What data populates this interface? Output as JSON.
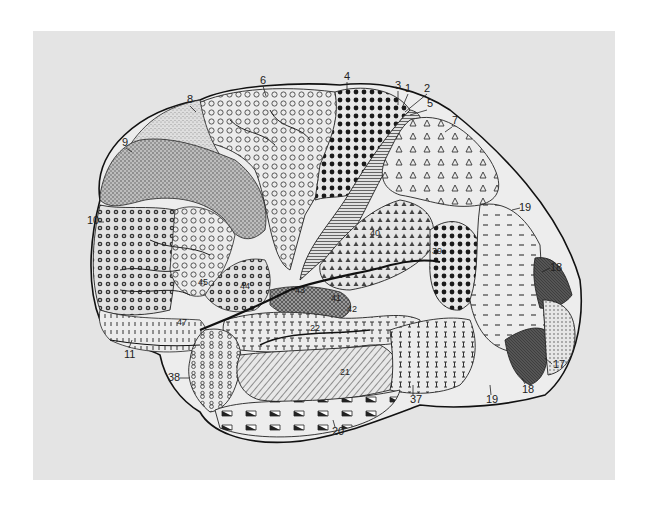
{
  "figure": {
    "background_color": "#e4e4e4",
    "labels": [
      {
        "id": "1",
        "text": "1",
        "x": 405,
        "y": 92
      },
      {
        "id": "2",
        "text": "2",
        "x": 424,
        "y": 92
      },
      {
        "id": "3",
        "text": "3",
        "x": 395,
        "y": 89
      },
      {
        "id": "4",
        "text": "4",
        "x": 344,
        "y": 80
      },
      {
        "id": "5",
        "text": "5",
        "x": 427,
        "y": 107
      },
      {
        "id": "6",
        "text": "6",
        "x": 260,
        "y": 84
      },
      {
        "id": "7",
        "text": "7",
        "x": 452,
        "y": 124
      },
      {
        "id": "8",
        "text": "8",
        "x": 187,
        "y": 103
      },
      {
        "id": "9",
        "text": "9",
        "x": 122,
        "y": 146
      },
      {
        "id": "10",
        "text": "10",
        "x": 87,
        "y": 224
      },
      {
        "id": "11",
        "text": "11",
        "x": 124,
        "y": 358
      },
      {
        "id": "17",
        "text": "17",
        "x": 553,
        "y": 368
      },
      {
        "id": "18a",
        "text": "18",
        "x": 550,
        "y": 271
      },
      {
        "id": "18b",
        "text": "18",
        "x": 522,
        "y": 393
      },
      {
        "id": "19a",
        "text": "19",
        "x": 519,
        "y": 211
      },
      {
        "id": "19b",
        "text": "19",
        "x": 486,
        "y": 403
      },
      {
        "id": "20",
        "text": "20",
        "x": 332,
        "y": 435
      },
      {
        "id": "21",
        "text": "21",
        "x": 340,
        "y": 375
      },
      {
        "id": "22",
        "text": "22",
        "x": 310,
        "y": 331
      },
      {
        "id": "37",
        "text": "37",
        "x": 410,
        "y": 403
      },
      {
        "id": "38",
        "text": "38",
        "x": 168,
        "y": 381
      },
      {
        "id": "39",
        "text": "39",
        "x": 432,
        "y": 254
      },
      {
        "id": "40",
        "text": "40",
        "x": 370,
        "y": 236
      },
      {
        "id": "41",
        "text": "41",
        "x": 331,
        "y": 301
      },
      {
        "id": "42",
        "text": "42",
        "x": 347,
        "y": 312
      },
      {
        "id": "43",
        "text": "43",
        "x": 295,
        "y": 293
      },
      {
        "id": "44",
        "text": "44",
        "x": 240,
        "y": 289
      },
      {
        "id": "45",
        "text": "45",
        "x": 198,
        "y": 285
      },
      {
        "id": "47",
        "text": "47",
        "x": 177,
        "y": 325
      }
    ]
  }
}
